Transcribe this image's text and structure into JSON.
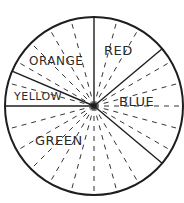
{
  "diagram": {
    "title": "",
    "stroke_color": "#1e1e1e",
    "background": "#ffffff",
    "segments": [
      {
        "name": "red",
        "label": "RED"
      },
      {
        "name": "blue",
        "label": "BLUE"
      },
      {
        "name": "green",
        "label": "GREEN"
      },
      {
        "name": "yellow",
        "label": "YELLOW"
      },
      {
        "name": "orange",
        "label": "ORANGE"
      }
    ]
  }
}
